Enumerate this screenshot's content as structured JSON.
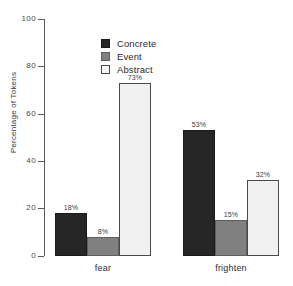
{
  "chart_data": {
    "type": "bar",
    "title": "",
    "subtitle": "",
    "xlabel": "",
    "ylabel": "Percentage of Tokens",
    "categories": [
      "fear",
      "frighten"
    ],
    "series": [
      {
        "name": "Concrete",
        "color": "#262626",
        "values": [
          18,
          53
        ],
        "labels": [
          "18%",
          "53%"
        ]
      },
      {
        "name": "Event",
        "color": "#808080",
        "values": [
          8,
          15
        ],
        "labels": [
          "8%",
          "15%"
        ]
      },
      {
        "name": "Abstract",
        "color": "#f0f0f0",
        "values": [
          73,
          32
        ],
        "labels": [
          "73%",
          "32%"
        ]
      }
    ],
    "ylim": [
      0,
      100
    ],
    "yticks": [
      0,
      20,
      40,
      60,
      80,
      100
    ],
    "ytick_labels": [
      "0",
      "20",
      "40",
      "60",
      "80",
      "100"
    ],
    "grid": false,
    "legend_position": "top-left-inside",
    "bar_value_labels": true,
    "grouped": true
  },
  "legend": {
    "entries": [
      {
        "label": "Concrete",
        "swatch": "concrete-swatch"
      },
      {
        "label": "Event",
        "swatch": "event-swatch"
      },
      {
        "label": "Abstract",
        "swatch": "abstract-swatch"
      }
    ]
  },
  "axes": {
    "y_title": "Percentage of Tokens",
    "y_labels": [
      "100",
      "80",
      "60",
      "40",
      "20",
      "0"
    ],
    "x_labels": [
      "fear",
      "frighten"
    ]
  }
}
